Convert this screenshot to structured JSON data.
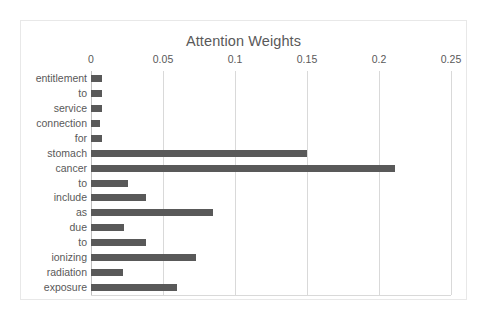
{
  "chart_data": {
    "type": "bar",
    "orientation": "horizontal",
    "title": "Attention Weights",
    "xlabel": "",
    "ylabel": "",
    "xlim": [
      0,
      0.25
    ],
    "xticks": [
      "0",
      "0.05",
      "0.1",
      "0.15",
      "0.2",
      "0.25"
    ],
    "xtick_values": [
      0,
      0.05,
      0.1,
      0.15,
      0.2,
      0.25
    ],
    "grid": true,
    "legend": false,
    "bar_color": "#595959",
    "categories": [
      "entitlement",
      "to",
      "service",
      "connection",
      "for",
      "stomach",
      "cancer",
      "to",
      "include",
      "as",
      "due",
      "to",
      "ionizing",
      "radiation",
      "exposure"
    ],
    "values": [
      0.0075,
      0.0075,
      0.0075,
      0.006,
      0.0075,
      0.15,
      0.211,
      0.026,
      0.038,
      0.085,
      0.023,
      0.038,
      0.073,
      0.022,
      0.06
    ]
  }
}
